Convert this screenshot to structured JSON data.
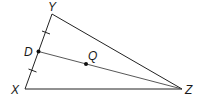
{
  "diagram": {
    "type": "triangle-geometry",
    "vertices": {
      "Y": {
        "label": "Y"
      },
      "X": {
        "label": "X"
      },
      "Z": {
        "label": "Z"
      }
    },
    "points": {
      "D": {
        "label": "D"
      },
      "Q": {
        "label": "Q"
      }
    },
    "segments": [
      "XY",
      "YZ",
      "XZ",
      "DZ"
    ],
    "congruence_marks": [
      "YD",
      "DX"
    ],
    "colors": {
      "line": "#222222",
      "point": "#111111",
      "background": "#ffffff"
    }
  }
}
